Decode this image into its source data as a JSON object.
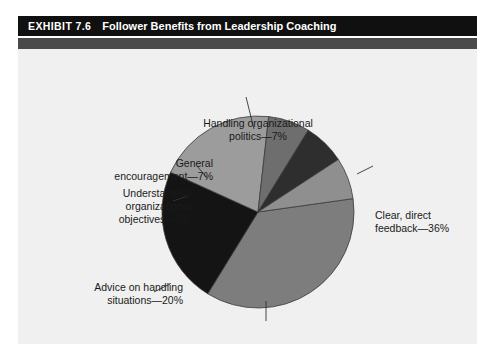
{
  "header": {
    "exhibit_number": "EXHIBIT 7.6",
    "title": "Follower Benefits from Leadership Coaching"
  },
  "chart_data": {
    "type": "pie",
    "title": "Follower Benefits from Leadership Coaching",
    "categories": [
      "Clear, direct feedback",
      "A new perspective",
      "Advice on handling situations",
      "Understanding organizational objectives",
      "General encouragement",
      "Handling organizational politics"
    ],
    "values": [
      36,
      23,
      20,
      7,
      7,
      7
    ],
    "unit": "%",
    "labels": [
      "Clear, direct\nfeedback—36%",
      "A new perspective—23%",
      "Advice on handling\nsituations—20%",
      "Understanding\norganizational\nobjectives—7%",
      "General\nencouragement—7%",
      "Handling organizational\npolitics—7%"
    ],
    "colors": [
      "#7d7d7d",
      "#141414",
      "#9c9c9c",
      "#6e6e6e",
      "#2e2e2e",
      "#8f8f8f"
    ],
    "start_angle_deg": -8,
    "legend": "none",
    "grid": false,
    "background": "#f0f0f0"
  }
}
